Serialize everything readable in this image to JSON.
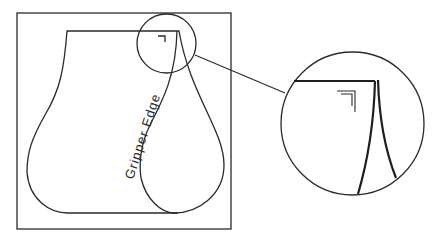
{
  "diagram": {
    "label": "Gripper Edge",
    "colors": {
      "stroke": "#2a2a2a",
      "background": "#ffffff"
    },
    "elements": [
      {
        "type": "frame",
        "name": "sheet-border"
      },
      {
        "type": "shape",
        "name": "vase-outline"
      },
      {
        "type": "shape",
        "name": "drop-outline"
      },
      {
        "type": "marker",
        "name": "corner-mark"
      },
      {
        "type": "callout",
        "name": "detail-circle-small"
      },
      {
        "type": "callout",
        "name": "detail-circle-magnified"
      }
    ]
  }
}
